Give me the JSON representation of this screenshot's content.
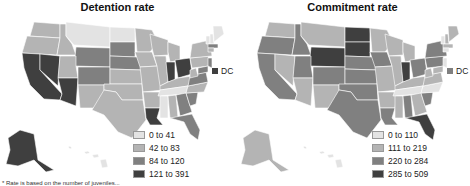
{
  "colors": {
    "c1": "#e3e3e3",
    "c2": "#b4b4b4",
    "c3": "#808080",
    "c4": "#3f3f3f",
    "border": "#ffffff"
  },
  "panels": [
    {
      "title": "Detention rate",
      "dc_label": "DC",
      "dc_class": "c4",
      "legend": [
        {
          "label": "0 to 41",
          "class": "c1"
        },
        {
          "label": "42 to 83",
          "class": "c2"
        },
        {
          "label": "84 to 120",
          "class": "c3"
        },
        {
          "label": "121 to 391",
          "class": "c4"
        }
      ]
    },
    {
      "title": "Commitment rate",
      "dc_label": "DC",
      "dc_class": "c3",
      "legend": [
        {
          "label": "0 to 110",
          "class": "c1"
        },
        {
          "label": "111 to 219",
          "class": "c2"
        },
        {
          "label": "220 to 284",
          "class": "c3"
        },
        {
          "label": "285 to 509",
          "class": "c4"
        }
      ]
    }
  ],
  "footnote": "* Rate is based on the number of juveniles..."
}
